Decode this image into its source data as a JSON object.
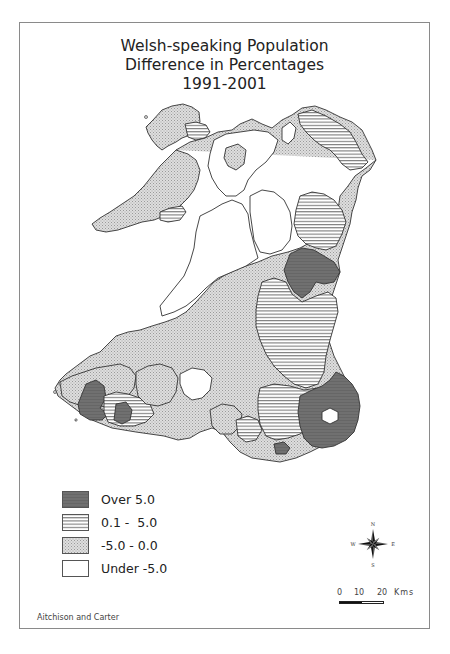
{
  "title": {
    "line1": "Welsh-speaking Population",
    "line2": "Difference in Percentages",
    "line3": "1991-2001"
  },
  "legend": {
    "items": [
      {
        "label": "Over 5.0",
        "pattern": "dark-solid",
        "color": "#6e6e6e"
      },
      {
        "label": "0.1 -  5.0",
        "pattern": "horizontal-lines",
        "color": "#888888"
      },
      {
        "label": "-5.0 - 0.0",
        "pattern": "stipple",
        "color": "#cfcfcf"
      },
      {
        "label": "Under -5.0",
        "pattern": "blank",
        "color": "#ffffff"
      }
    ]
  },
  "compass": {
    "n": "N",
    "s": "S",
    "e": "E",
    "w": "W"
  },
  "scale": {
    "ticks": [
      "0",
      "10",
      "20"
    ],
    "unit": "Kms"
  },
  "attribution": "Aitchison and Carter",
  "colors": {
    "frame": "#8a8a8a",
    "outline": "#333333",
    "over5": "#6e6e6e",
    "hatch": "#777777",
    "stipple": "#d2d2d2"
  }
}
